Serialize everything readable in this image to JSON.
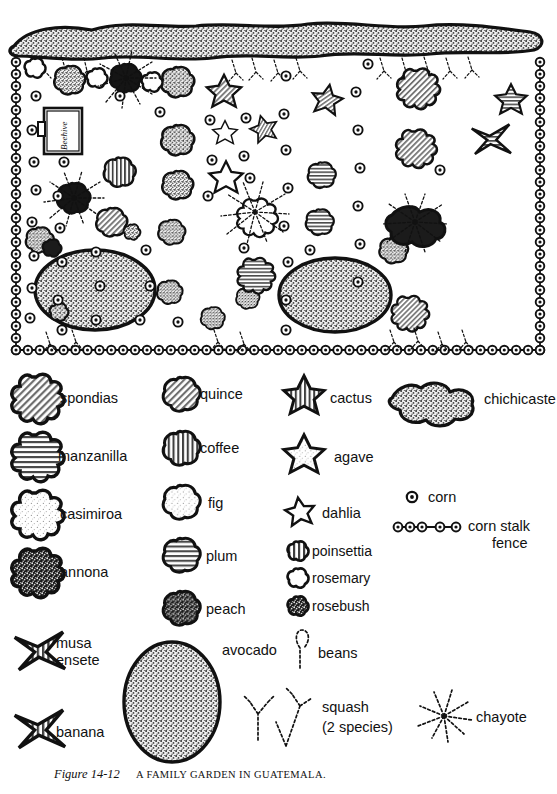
{
  "figure": {
    "caption_prefix": "Figure 14-12",
    "caption_main": "A FAMILY GARDEN IN GUATEMALA.",
    "map_label_beehive": "Beehive"
  },
  "colors": {
    "ink": "#111111",
    "paper": "#ffffff",
    "hatch_mid": "#9a9a9a",
    "hatch_light": "#dcdcdc",
    "stipple_dark": "#3a3a3a",
    "stipple_mid": "#b0b0b0"
  },
  "legend": {
    "columns": [
      {
        "name": "column-1-trees",
        "items": [
          {
            "key": "spondias",
            "label": "spondias",
            "symbol": "blob-diagonal-hatch"
          },
          {
            "key": "manzanilla",
            "label": "manzanilla",
            "symbol": "blob-horizontal-hatch"
          },
          {
            "key": "casimiroa",
            "label": "casimiroa",
            "symbol": "blob-light-stipple"
          },
          {
            "key": "annona",
            "label": "annona",
            "symbol": "blob-dark-stipple"
          },
          {
            "key": "musa",
            "label": "musa\nensete",
            "symbol": "star-4-point-hatch"
          },
          {
            "key": "banana",
            "label": "banana",
            "symbol": "star-4-point-hatch"
          }
        ]
      },
      {
        "name": "column-2-round-trees",
        "items": [
          {
            "key": "quince",
            "label": "quince",
            "symbol": "circle-diagonal-hatch"
          },
          {
            "key": "coffee",
            "label": "coffee",
            "symbol": "circle-vertical-hatch"
          },
          {
            "key": "fig",
            "label": "fig",
            "symbol": "circle-light-stipple"
          },
          {
            "key": "plum",
            "label": "plum",
            "symbol": "circle-horizontal-hatch"
          },
          {
            "key": "peach",
            "label": "peach",
            "symbol": "circle-dark-stipple"
          }
        ]
      },
      {
        "name": "column-3-stars-shrubs",
        "items": [
          {
            "key": "cactus",
            "label": "cactus",
            "symbol": "star-5-vertical-hatch"
          },
          {
            "key": "agave",
            "label": "agave",
            "symbol": "star-5-light-stipple"
          },
          {
            "key": "dahlia",
            "label": "dahlia",
            "symbol": "star-5-thin-outline"
          },
          {
            "key": "poinsettia",
            "label": "poinsettia",
            "symbol": "small-blob-vertical-hatch"
          },
          {
            "key": "rosemary",
            "label": "rosemary",
            "symbol": "small-blob-outline"
          },
          {
            "key": "rosebush",
            "label": "rosebush",
            "symbol": "small-blob-dark-stipple"
          }
        ]
      },
      {
        "name": "column-4-misc",
        "items": [
          {
            "key": "chichicaste",
            "label": "chichicaste",
            "symbol": "hedge-lobed-stipple"
          },
          {
            "key": "corn",
            "label": "corn",
            "symbol": "small-ringed-dot"
          },
          {
            "key": "corn_stalk_fence",
            "label": "corn stalk\nfence",
            "symbol": "chain-of-ringed-dots"
          }
        ]
      }
    ],
    "bottom_items": [
      {
        "key": "avocado",
        "label": "avocado",
        "symbol": "large-oval-stipple"
      },
      {
        "key": "beans",
        "label": "beans",
        "symbol": "dotted-vine-single"
      },
      {
        "key": "squash",
        "label": "squash\n(2 species)",
        "symbol": "dotted-vine-pair"
      },
      {
        "key": "chayote",
        "label": "chayote",
        "symbol": "dotted-radiating-vine"
      }
    ]
  },
  "map": {
    "name": "family-garden-plan",
    "boundary": "corn-stalk-fence-perimeter",
    "top_hedge": "chichicaste-hedge",
    "contents": [
      "chichicaste hedge along north edge",
      "corn stalk fence on east, west and south sides",
      "squash vines along fence lines",
      "scattered corn plants",
      "fruit trees: annona, peach, quince, coffee, plum, fig, casimiroa, spondias, manzanilla",
      "two large avocado trees",
      "cactus, agave and dahlia near the east side",
      "musa ensete and banana",
      "beehive on the west side"
    ]
  }
}
